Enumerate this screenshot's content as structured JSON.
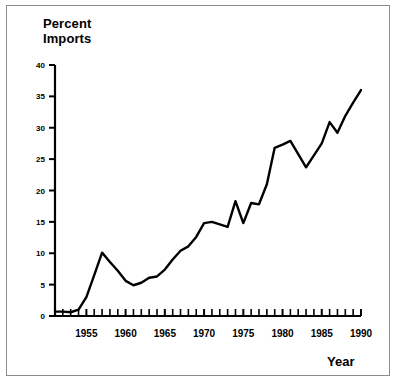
{
  "figure": {
    "y_axis_title_line1": "Percent",
    "y_axis_title_line2": "Imports",
    "x_axis_title": "Year"
  },
  "chart_data": {
    "type": "line",
    "title": "",
    "subtitle": "",
    "xlabel": "Year",
    "ylabel": "Percent Imports",
    "xlim": [
      1951,
      1990
    ],
    "ylim": [
      0,
      40
    ],
    "grid": false,
    "legend": null,
    "y_ticks": [
      0,
      5,
      10,
      15,
      20,
      25,
      30,
      35,
      40
    ],
    "y_tick_labels": [
      "0",
      "5",
      "10",
      "15",
      "20",
      "25",
      "30",
      "35",
      "40"
    ],
    "x_ticks": [
      1955,
      1960,
      1965,
      1970,
      1975,
      1980,
      1985,
      1990
    ],
    "x_tick_labels": [
      "1955",
      "1960",
      "1965",
      "1970",
      "1975",
      "1980",
      "1985",
      "1990"
    ],
    "x_minor_tick_interval": 1,
    "line_color": "#000000",
    "line_width": 2.4,
    "series": [
      {
        "name": "Percent Imports",
        "x": [
          1951,
          1952,
          1953,
          1954,
          1955,
          1956,
          1957,
          1958,
          1959,
          1960,
          1961,
          1962,
          1963,
          1964,
          1965,
          1966,
          1967,
          1968,
          1969,
          1970,
          1971,
          1972,
          1973,
          1974,
          1975,
          1976,
          1977,
          1978,
          1979,
          1980,
          1981,
          1982,
          1983,
          1984,
          1985,
          1986,
          1987,
          1988,
          1989,
          1990
        ],
        "values": [
          0.7,
          0.7,
          0.6,
          1.0,
          3.0,
          6.5,
          10.1,
          8.6,
          7.2,
          5.6,
          4.9,
          5.3,
          6.1,
          6.3,
          7.4,
          9.0,
          10.4,
          11.1,
          12.6,
          14.8,
          15.0,
          14.6,
          14.2,
          18.3,
          14.8,
          18.0,
          17.8,
          21.0,
          26.8,
          27.3,
          27.9,
          25.8,
          23.7,
          25.6,
          27.5,
          30.9,
          29.2,
          31.9,
          34.0,
          36.0
        ]
      }
    ]
  }
}
